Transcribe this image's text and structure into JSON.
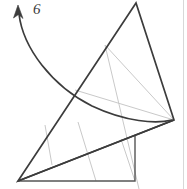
{
  "figure": {
    "canvas": {
      "width": 187,
      "height": 189,
      "background": "#ffffff"
    },
    "colors": {
      "stroke_dark": "#3c3c3c",
      "stroke_medium": "#555555",
      "stroke_light": "#c9c9c9",
      "border": "#d8d8d8",
      "label": "#3a3a3a"
    },
    "annotation": {
      "rotation_label": "6",
      "label_x": 33,
      "label_y": 4,
      "arrow_name": "rotation-arc-arrow"
    },
    "shapes": {
      "rotated_triangle": {
        "name": "rotated-triangle",
        "points": "136,3 18,181 174,120",
        "stroke": "#3c3c3c",
        "stroke_width": 1.6
      },
      "base_square": {
        "name": "base-square",
        "points": "18,181 135,181 135,136 18,136",
        "stroke": "#555555",
        "stroke_width": 1.5
      },
      "chord_line": {
        "name": "chord-line",
        "x1": 18,
        "y1": 181,
        "x2": 174,
        "y2": 120,
        "stroke": "#3c3c3c",
        "stroke_width": 1.5
      }
    },
    "construction_lines": [
      {
        "name": "construction-line-upper",
        "x1": 105,
        "y1": 45,
        "x2": 139,
        "y2": 189,
        "stroke": "#c9c9c9"
      },
      {
        "name": "construction-line-chord-upper",
        "x1": 75,
        "y1": 90,
        "x2": 174,
        "y2": 120,
        "stroke": "#c9c9c9"
      },
      {
        "name": "construction-line-apex-right",
        "x1": 105,
        "y1": 45,
        "x2": 174,
        "y2": 120,
        "stroke": "#c9c9c9"
      },
      {
        "name": "construction-line-left-rib",
        "x1": 45,
        "y1": 125,
        "x2": 52,
        "y2": 163,
        "stroke": "#c9c9c9"
      },
      {
        "name": "construction-line-mid-rib",
        "x1": 78,
        "y1": 122,
        "x2": 95,
        "y2": 181,
        "stroke": "#c9c9c9"
      },
      {
        "name": "construction-line-right-rib",
        "x1": 135,
        "y1": 136,
        "x2": 174,
        "y2": 120,
        "stroke": "#c9c9c9"
      }
    ],
    "arc": {
      "name": "rotation-arc",
      "path": "M 18 13 C 22 45, 50 85, 92 105 C 125 121, 155 124, 173 120",
      "stroke": "#3c3c3c",
      "stroke_width": 1.6
    },
    "arrow_head": {
      "name": "arrow-head",
      "points": "18,6 14,17 18,14 22,18",
      "fill": "#3c3c3c"
    },
    "page_border": {
      "name": "page-border-right",
      "x1": 183,
      "y1": 0,
      "x2": 183,
      "y2": 189,
      "stroke": "#d8d8d8"
    }
  }
}
